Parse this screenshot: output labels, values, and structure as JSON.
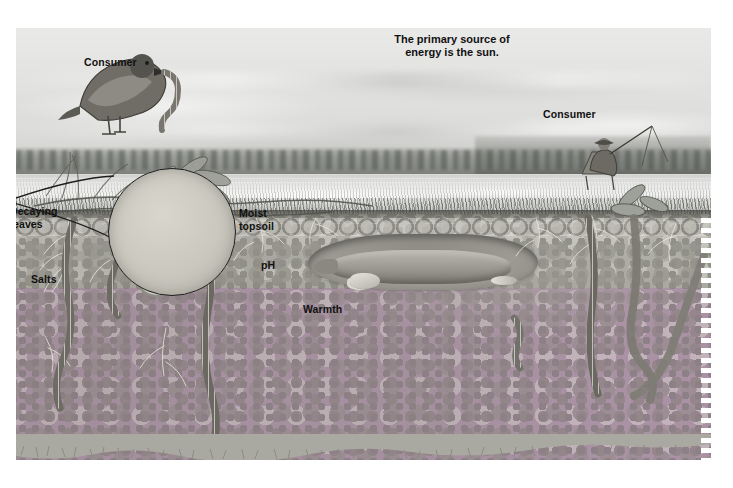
{
  "figure": {
    "type": "illustration",
    "style": "grayscale pencil/airbrush educational diagram",
    "title_note": {
      "text": "The primary source of\nenergy is the sun.",
      "x": 372,
      "y": 33
    },
    "labels": [
      {
        "id": "consumer-bird",
        "text": "Consumer",
        "x": 84,
        "y": 56
      },
      {
        "id": "consumer-angler",
        "text": "Consumer",
        "x": 543,
        "y": 108
      },
      {
        "id": "decaying-leaves",
        "text": "Decaying\nleaves",
        "x": 10,
        "y": 205
      },
      {
        "id": "moist-topsoil",
        "text": "Moist\ntopsoil",
        "x": 239,
        "y": 207
      },
      {
        "id": "salts",
        "text": "Salts",
        "x": 31,
        "y": 273
      },
      {
        "id": "ph",
        "text": "pH",
        "x": 261,
        "y": 259
      },
      {
        "id": "warmth",
        "text": "Warmth",
        "x": 303,
        "y": 303
      }
    ],
    "scene_elements": [
      {
        "name": "sky",
        "description": "pale overcast sky with soft cloud bands"
      },
      {
        "name": "distant-treeline",
        "description": "dark low treeline across the horizon"
      },
      {
        "name": "pond",
        "description": "bright still lake water surface"
      },
      {
        "name": "marsh-grass",
        "description": "grass and reeds along the shoreline"
      },
      {
        "name": "bird",
        "description": "songbird perched on a stem holding an earthworm in its beak"
      },
      {
        "name": "angler",
        "description": "seated fisherman with hat, chair and fishing rod"
      },
      {
        "name": "broadleaf-plants",
        "description": "broadleaf plants at left on the soil surface"
      },
      {
        "name": "soil-block",
        "description": "cut-away soil profile with speckled texture"
      },
      {
        "name": "mole",
        "description": "mole resting inside a horizontal burrow"
      },
      {
        "name": "earthworms",
        "description": "segmented earthworms in vertical burrows"
      },
      {
        "name": "roots",
        "description": "fine white plant roots branching through the soil"
      },
      {
        "name": "magnifier",
        "description": "circular magnified inset showing a nematode, a larva and a grub"
      },
      {
        "name": "leader-lines",
        "description": "two lines from the Warmth point fanning out to the magnifier circle"
      },
      {
        "name": "ragged-edge",
        "description": "torn bottom and right edges of the illustration plate"
      }
    ],
    "colors": {
      "ink": "#111111",
      "sky_light": "#e9e9e8",
      "sky_dark": "#c9cbc6",
      "water_light": "#f0f1ef",
      "soil": "#a9a8a1",
      "soil_dark": "#6e6c64",
      "burrow": "#8a8880",
      "page_background": "#ffffff"
    }
  }
}
